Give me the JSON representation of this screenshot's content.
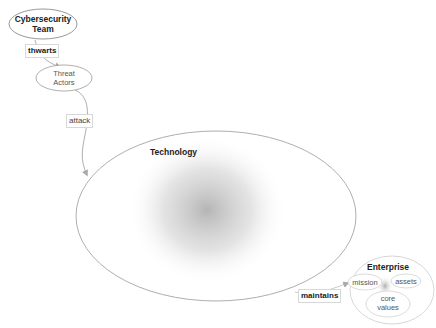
{
  "nodes": {
    "cybersecurity_team": {
      "label_line1": "Cybersecurity",
      "label_line2": "Team"
    },
    "threat_actors": {
      "label_line1": "Threat",
      "label_line2": "Actors"
    },
    "technology": {
      "label": "Technology"
    },
    "enterprise": {
      "label": "Enterprise",
      "children": {
        "mission": "mission",
        "assets": "assets",
        "core_values_line1": "core",
        "core_values_line2": "values"
      }
    }
  },
  "edges": {
    "thwarts": "thwarts",
    "attack": "attack",
    "maintains": "maintains"
  },
  "colors": {
    "stroke": "#999999",
    "light_stroke": "#cccccc",
    "arrow": "#aaaaaa",
    "shade": "#b0b0b0"
  }
}
